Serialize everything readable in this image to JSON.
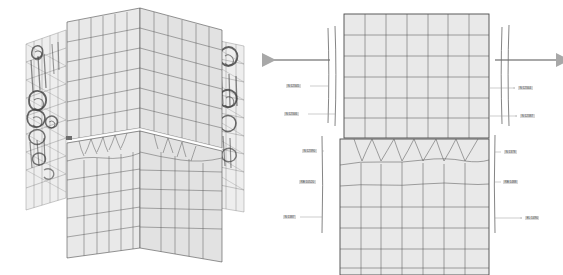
{
  "figure": {
    "background_color": "#ffffff",
    "mesh_line_color": "#5a5a5a",
    "mesh_fill_color": "#e8e8e8",
    "rebar_color": "#6f6f6f",
    "damage_color": "#3a3a3a",
    "arrow_color": "#a8a8a8",
    "label_text_color": "#4a4a4a",
    "label_bg_color": "#d9d9d9",
    "crack_color": "#ffffff"
  },
  "panels": [
    {
      "id": "left",
      "name": "isometric-3d-view",
      "description": "Isometric 3D view of column with crack and reinforcement damage contours"
    },
    {
      "id": "right",
      "name": "elevation-2d-view",
      "description": "2D elevation of separated mesh blocks with reinforcement and node labels"
    }
  ],
  "arrows": [
    {
      "name": "load-arrow-left",
      "direction": "left",
      "label": ""
    },
    {
      "name": "load-arrow-right",
      "direction": "right",
      "label": ""
    }
  ],
  "labels_left": [
    {
      "id": "L1",
      "text": "N:12345",
      "x": 4,
      "y": 84
    },
    {
      "id": "L2",
      "text": "N:12346",
      "x": 2,
      "y": 112
    },
    {
      "id": "L3",
      "text": "N:12390",
      "x": 20,
      "y": 149
    },
    {
      "id": "L4",
      "text": "RB:10520",
      "x": 17,
      "y": 180
    },
    {
      "id": "L5",
      "text": "N:1387",
      "x": 1,
      "y": 215
    }
  ],
  "labels_right": [
    {
      "id": "R1",
      "text": "N:12344",
      "x": 236,
      "y": 86
    },
    {
      "id": "R2",
      "text": "N:12387",
      "x": 238,
      "y": 114
    },
    {
      "id": "R3",
      "text": "N:1378",
      "x": 222,
      "y": 150
    },
    {
      "id": "R4",
      "text": "RB:1488",
      "x": 221,
      "y": 180
    },
    {
      "id": "R5",
      "text": "EL:1490",
      "x": 243,
      "y": 216
    }
  ],
  "mesh": {
    "upper_block": {
      "columns": 7,
      "rows": 6,
      "type": "structured-grid"
    },
    "lower_block": {
      "columns": 7,
      "rows": 7,
      "type": "transition-refined-grid"
    },
    "crack_gap": {
      "present": true,
      "orientation": "horizontal"
    }
  },
  "rebar_lines": {
    "left_bundle_upper": 2,
    "left_bundle_lower": 1,
    "right_bundle_upper": 2,
    "right_bundle_lower": 1
  }
}
